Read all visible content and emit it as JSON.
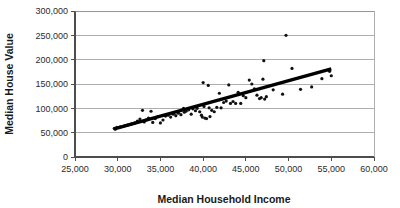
{
  "chart_data": {
    "type": "scatter",
    "title": "",
    "xlabel": "Median Household Income",
    "ylabel": "Median House Value",
    "xlim": [
      25000,
      60000
    ],
    "ylim": [
      0,
      300000
    ],
    "grid": true,
    "legend": "none",
    "xticks": [
      "25,000",
      "30,000",
      "35,000",
      "40,000",
      "45,000",
      "50,000",
      "55,000",
      "60,000"
    ],
    "xtick_values": [
      25000,
      30000,
      35000,
      40000,
      45000,
      50000,
      55000,
      60000
    ],
    "yticks": [
      "0",
      "50,000",
      "100,000",
      "150,000",
      "200,000",
      "250,000",
      "300,000"
    ],
    "ytick_values": [
      0,
      50000,
      100000,
      150000,
      200000,
      250000,
      300000
    ],
    "series": [
      {
        "name": "Counties",
        "marker": "dot",
        "color": "#111111",
        "points": [
          [
            29600,
            59000
          ],
          [
            29700,
            57000
          ],
          [
            29900,
            61000
          ],
          [
            30300,
            62000
          ],
          [
            30800,
            64000
          ],
          [
            31200,
            66000
          ],
          [
            31600,
            68000
          ],
          [
            32000,
            70000
          ],
          [
            32300,
            74000
          ],
          [
            32600,
            78000
          ],
          [
            32900,
            96000
          ],
          [
            33100,
            72000
          ],
          [
            33300,
            76000
          ],
          [
            33600,
            80000
          ],
          [
            33900,
            94000
          ],
          [
            34100,
            71000
          ],
          [
            34400,
            79000
          ],
          [
            34700,
            83000
          ],
          [
            35000,
            70000
          ],
          [
            35300,
            76000
          ],
          [
            35600,
            84000
          ],
          [
            35900,
            86000
          ],
          [
            36200,
            82000
          ],
          [
            36500,
            88000
          ],
          [
            36800,
            85000
          ],
          [
            37100,
            90000
          ],
          [
            37400,
            87000
          ],
          [
            37700,
            100000
          ],
          [
            37800,
            92000
          ],
          [
            38000,
            94000
          ],
          [
            38300,
            97000
          ],
          [
            38600,
            88000
          ],
          [
            38800,
            99000
          ],
          [
            39100,
            95000
          ],
          [
            39300,
            100000
          ],
          [
            39600,
            93000
          ],
          [
            39800,
            86000
          ],
          [
            39900,
            82000
          ],
          [
            40000,
            153000
          ],
          [
            40100,
            104000
          ],
          [
            40200,
            80000
          ],
          [
            40400,
            79000
          ],
          [
            40600,
            147000
          ],
          [
            40700,
            101000
          ],
          [
            40800,
            83000
          ],
          [
            41000,
            96000
          ],
          [
            41300,
            93000
          ],
          [
            41600,
            102000
          ],
          [
            41900,
            131000
          ],
          [
            42100,
            101000
          ],
          [
            42400,
            112000
          ],
          [
            42700,
            115000
          ],
          [
            43000,
            148000
          ],
          [
            43200,
            110000
          ],
          [
            43500,
            114000
          ],
          [
            43800,
            110000
          ],
          [
            44100,
            133000
          ],
          [
            44400,
            110000
          ],
          [
            44700,
            126000
          ],
          [
            45000,
            122000
          ],
          [
            45400,
            158000
          ],
          [
            45700,
            150000
          ],
          [
            46000,
            140000
          ],
          [
            46300,
            127000
          ],
          [
            46600,
            120000
          ],
          [
            46800,
            122000
          ],
          [
            47000,
            160000
          ],
          [
            47100,
            198000
          ],
          [
            47200,
            119000
          ],
          [
            47400,
            124000
          ],
          [
            48200,
            138000
          ],
          [
            49300,
            129000
          ],
          [
            49700,
            250000
          ],
          [
            50400,
            182000
          ],
          [
            51400,
            139000
          ],
          [
            52700,
            144000
          ],
          [
            53900,
            161000
          ],
          [
            54800,
            176000
          ],
          [
            55000,
            167000
          ]
        ]
      }
    ],
    "trendline": {
      "name": "linear-fit",
      "x_start": 29600,
      "y_start": 58000,
      "x_end": 55000,
      "y_end": 181000
    }
  }
}
